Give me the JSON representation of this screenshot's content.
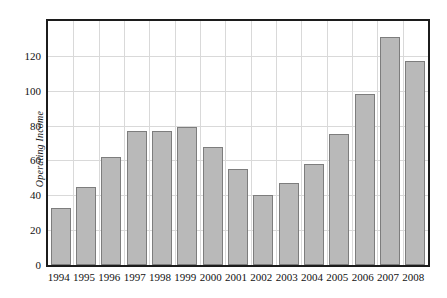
{
  "chart_data": {
    "type": "bar",
    "title": "",
    "subtitle": "",
    "xlabel": "",
    "ylabel": "Operating Income",
    "categories": [
      "1994",
      "1995",
      "1996",
      "1997",
      "1998",
      "1999",
      "2000",
      "2001",
      "2002",
      "2003",
      "2004",
      "2005",
      "2006",
      "2007",
      "2008"
    ],
    "values": [
      33,
      45,
      62,
      77,
      77,
      79,
      68,
      55,
      40,
      47,
      58,
      75,
      98,
      131,
      117
    ],
    "ylim": [
      0,
      140
    ],
    "yticks": [
      0,
      20,
      40,
      60,
      80,
      100,
      120
    ],
    "ytick_labels": [
      "0",
      "20",
      "40",
      "60",
      "80",
      "100",
      "120"
    ],
    "grid": true,
    "legend": "none",
    "bar_fill_color": "#b9b9b9",
    "bar_border_color": "#7d7d7d",
    "grid_color": "#d9d9d9",
    "frame_color": "#1c1c1c",
    "background_color": "#ffffff"
  }
}
